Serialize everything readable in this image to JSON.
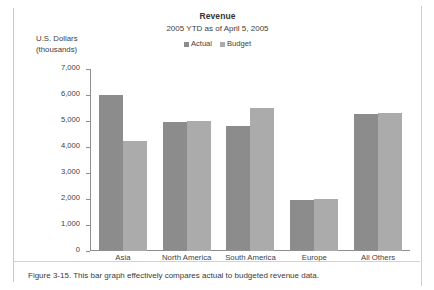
{
  "figure": {
    "caption": "Figure 3-15. This bar graph effectively compares actual to budgeted revenue data."
  },
  "chart_data": {
    "type": "bar",
    "title": "Revenue",
    "subtitle": "2005 YTD as of April 5, 2005",
    "ylabel_line1": "U.S. Dollars",
    "ylabel_line2": "(thousands)",
    "xlabel": "",
    "ylim": [
      0,
      7000
    ],
    "ytick_step": 1000,
    "grid": false,
    "legend_position": "top-center",
    "categories": [
      "Asia",
      "North America",
      "South America",
      "Europe",
      "All Others"
    ],
    "ytick_labels": [
      "7,000",
      "6,000",
      "5,000",
      "4,000",
      "3,000",
      "2,000",
      "1,000",
      "0"
    ],
    "ytick_values": [
      7000,
      6000,
      5000,
      4000,
      3000,
      2000,
      1000,
      0
    ],
    "series": [
      {
        "name": "Actual",
        "color": "#8c8c8c",
        "values": [
          6000,
          4950,
          4800,
          1950,
          5280
        ]
      },
      {
        "name": "Budget",
        "color": "#ababab",
        "values": [
          4250,
          5000,
          5500,
          2000,
          5320
        ]
      }
    ]
  }
}
